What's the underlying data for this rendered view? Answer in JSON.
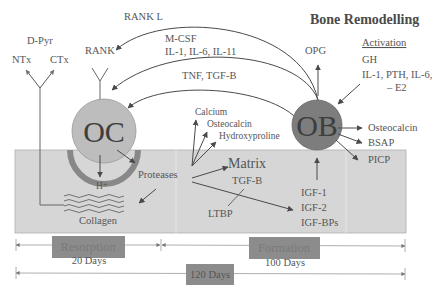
{
  "title": "Bone Remodelling",
  "cells": {
    "osteoclast": "OC",
    "osteoblast": "OB"
  },
  "top_left": {
    "d_pyr": "D-Pyr",
    "ntx": "NTx",
    "ctx": "CTx",
    "rank": "RANK"
  },
  "signals": {
    "rank_l": "RANK L",
    "mcsf": "M-CSF",
    "interleukins": "IL-1, IL-6, IL-11",
    "tnf_tgf": "TNF, TGF-B",
    "opg": "OPG"
  },
  "activation": {
    "heading": "Activation",
    "line1": "GH",
    "line2": "IL-1, PTH, IL-6,",
    "line3": "– E2"
  },
  "released": {
    "calcium": "Calcium",
    "osteocalcin": "Osteocalcin",
    "hydroxyproline": "Hydroxyproline"
  },
  "ob_products": {
    "osteocalcin": "Osteocalcin",
    "bsap": "BSAP",
    "picp": "PICP"
  },
  "bone": {
    "h_plus": "H⁺",
    "proteases": "Proteases",
    "collagen": "Collagen",
    "matrix": "Matrix",
    "tgf_b": "TGF-B",
    "ltbp": "LTBP",
    "igf1": "IGF-1",
    "igf2": "IGF-2",
    "igfbps": "IGF-BPs"
  },
  "timeline": {
    "resorption_label": "Resorption",
    "resorption_days": "20 Days",
    "formation_label": "Formation",
    "formation_days": "100 Days",
    "total_days": "120 Days"
  },
  "colors": {
    "bone_fill": "#d6d6d6",
    "oc_fill": "#bdbdbd",
    "ob_fill": "#7d7d7d",
    "label_box": "#8c8c8c",
    "arrow": "#4a4a4a"
  }
}
